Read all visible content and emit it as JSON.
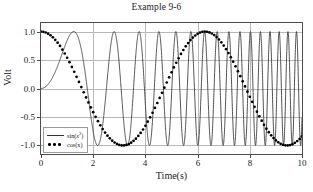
{
  "chart_data": {
    "type": "line",
    "title": "Example 9-6",
    "xlabel": "Time(s)",
    "ylabel": "Volt",
    "xlim": [
      0,
      10
    ],
    "ylim": [
      -1.15,
      1.15
    ],
    "grid": true,
    "legend_position": "lower left",
    "xticks": [
      "0",
      "2",
      "4",
      "6",
      "8",
      "10"
    ],
    "xtick_values": [
      0,
      2,
      4,
      6,
      8,
      10
    ],
    "yticks": [
      "1.0",
      "0.5",
      "0.0",
      "-0.5",
      "-1.0"
    ],
    "ytick_values": [
      1.0,
      0.5,
      0.0,
      -0.5,
      -1.0
    ],
    "series": [
      {
        "name": "sin(x²)",
        "label_base": "sin(x",
        "label_exp": "2",
        "label_tail": ")",
        "style": "solid",
        "color": "#333333",
        "formula": "sin(t^2)",
        "x_start": 0,
        "x_end": 10,
        "samples": 3000
      },
      {
        "name": "cos(x)",
        "label_base": "cos(x)",
        "style": "dotted",
        "color": "#000000",
        "formula": "cos(t)",
        "x_start": 0,
        "x_end": 10,
        "samples": 110
      }
    ]
  },
  "colors": {
    "background": "#ffffff",
    "axis": "#4d4d4d",
    "grid": "#b8b8b8",
    "text": "#1a1a1a"
  }
}
